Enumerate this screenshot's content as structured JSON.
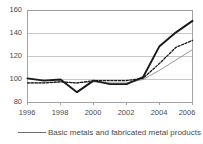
{
  "chart_data": {
    "type": "line",
    "title": "",
    "xlabel": "",
    "ylabel": "",
    "x": [
      1996,
      1997,
      1998,
      1999,
      2000,
      2001,
      2002,
      2003,
      2004,
      2005,
      2006
    ],
    "xlim": [
      1996,
      2006
    ],
    "ylim": [
      80,
      160
    ],
    "yticks": [
      80,
      100,
      120,
      140,
      160
    ],
    "xticks": [
      1996,
      1998,
      2000,
      2002,
      2004,
      2006
    ],
    "grid": "horizontal",
    "legend_position": "bottom",
    "series": [
      {
        "name": "Basic metals and fabricated metal products",
        "style": "solid-thick",
        "color": "#1a1a1a",
        "values": [
          101,
          99,
          100,
          89,
          99,
          96,
          96,
          102,
          129,
          141,
          151
        ]
      },
      {
        "name": "",
        "style": "dotted",
        "color": "#1a1a1a",
        "values": [
          97,
          97,
          98,
          97,
          99,
          99,
          99,
          101,
          114,
          128,
          134
        ]
      },
      {
        "name": "",
        "style": "solid-thin",
        "color": "#9a9a9a",
        "values": [
          97,
          97,
          98,
          97,
          98,
          97,
          97,
          100,
          108,
          117,
          126
        ]
      }
    ]
  },
  "axis": {
    "y_tick_labels": [
      "160",
      "140",
      "120",
      "100",
      "80"
    ],
    "x_tick_labels": [
      "1996",
      "1998",
      "2000",
      "2002",
      "2004",
      "2006"
    ]
  },
  "legend": {
    "entries": [
      {
        "label": "Basic metals and fabricated metal products",
        "swatch": "solid-line-swatch"
      }
    ]
  },
  "colors": {
    "series_primary": "#1a1a1a",
    "series_secondary": "#1a1a1a",
    "series_tertiary": "#9a9a9a",
    "grid": "#b9b9b9",
    "frame": "#9a9a9a",
    "text": "#4a4a4a",
    "background": "#ffffff"
  }
}
